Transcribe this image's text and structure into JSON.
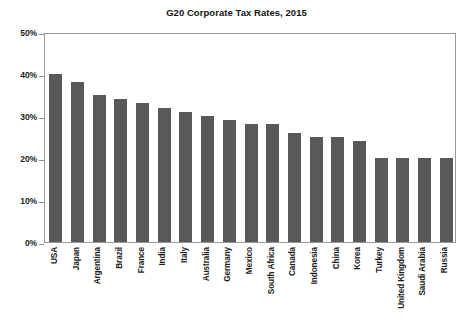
{
  "chart_data": {
    "type": "bar",
    "title": "G20 Corporate Tax Rates, 2015",
    "xlabel": "",
    "ylabel": "",
    "ylim": [
      0,
      50
    ],
    "ytick_labels": [
      "50%",
      "40%",
      "30%",
      "20%",
      "10%",
      "0%"
    ],
    "ytick_values": [
      50,
      40,
      30,
      20,
      10,
      0
    ],
    "grid": false,
    "legend": null,
    "bar_color": "#595959",
    "frame_color": "#9a9a9a",
    "units": "percent",
    "categories": [
      "USA",
      "Japan",
      "Argentina",
      "Brazil",
      "France",
      "India",
      "Italy",
      "Australia",
      "Germany",
      "Mexico",
      "South Africa",
      "Canada",
      "Indonesia",
      "China",
      "Korea",
      "Turkey",
      "United Kingdom",
      "Saudi Arabia",
      "Russia"
    ],
    "values": [
      40,
      38,
      35,
      34,
      33,
      32,
      31,
      30,
      29,
      28,
      28,
      26,
      25,
      25,
      24,
      20,
      20,
      20,
      20
    ]
  }
}
